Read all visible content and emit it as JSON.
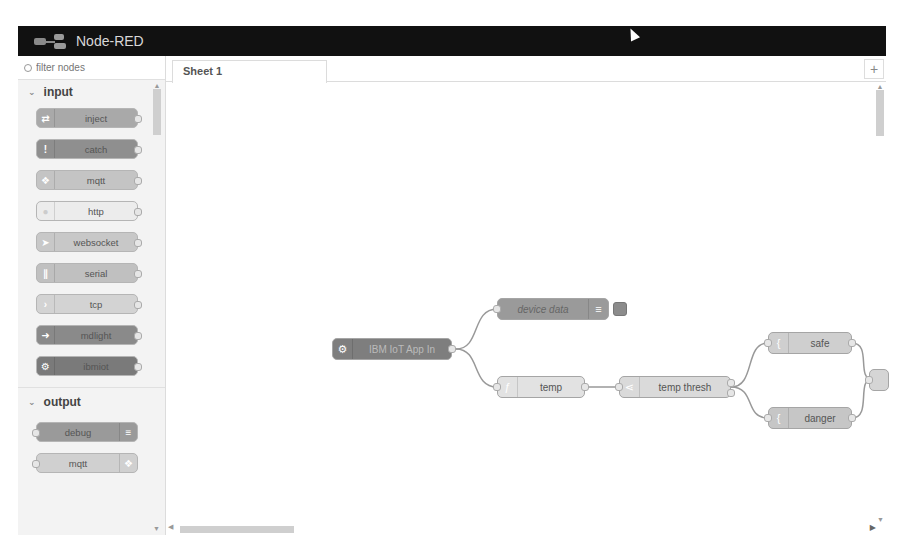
{
  "header": {
    "title": "Node-RED"
  },
  "palette": {
    "filter": {
      "placeholder": "filter nodes",
      "value": ""
    },
    "categories": [
      {
        "label": "input",
        "nodes": [
          {
            "label": "inject",
            "icon": "arrow-icon",
            "color": "#a6bbcf"
          },
          {
            "label": "catch",
            "icon": "exclamation-icon",
            "color": "#8f8f8f"
          },
          {
            "label": "mqtt",
            "icon": "bridge-icon",
            "color": "#c4c4c4"
          },
          {
            "label": "http",
            "icon": "globe-icon",
            "color": "#e6e6e6"
          },
          {
            "label": "websocket",
            "icon": "arrow-icon",
            "color": "#c8c8c8"
          },
          {
            "label": "serial",
            "icon": "serial-icon",
            "color": "#c0c0c0"
          },
          {
            "label": "tcp",
            "icon": "bridge-icon",
            "color": "#d0d0d0"
          },
          {
            "label": "mdlight",
            "icon": "light-icon",
            "color": "#8a8a8a"
          },
          {
            "label": "ibmiot",
            "icon": "gear-icon",
            "color": "#7a7a7a"
          }
        ]
      },
      {
        "label": "output",
        "nodes": [
          {
            "label": "debug",
            "icon": "list-icon",
            "color": "#9a9a9a"
          },
          {
            "label": "mqtt",
            "icon": "bridge-icon",
            "color": "#d0d0d0"
          }
        ]
      }
    ]
  },
  "workspace": {
    "tabs": [
      {
        "label": "Sheet 1"
      }
    ],
    "add_tab_label": "+",
    "flow": {
      "nodes": [
        {
          "id": "iot",
          "label": "IBM IoT App In",
          "x": 166,
          "y": 255,
          "w": 120,
          "color": "#7e7e7e",
          "icon": "gear-icon"
        },
        {
          "id": "device",
          "label": "device data",
          "x": 331,
          "y": 215,
          "w": 112,
          "color": "#9a9a9a",
          "icon": "list-icon"
        },
        {
          "id": "temp",
          "label": "temp",
          "x": 331,
          "y": 293,
          "w": 88,
          "color": "#e2e2e2",
          "icon": "function-icon"
        },
        {
          "id": "thresh",
          "label": "temp thresh",
          "x": 453,
          "y": 293,
          "w": 112,
          "color": "#dadada",
          "icon": "switch-icon"
        },
        {
          "id": "safe",
          "label": "safe",
          "x": 602,
          "y": 249,
          "w": 84,
          "color": "#cfcfcf",
          "icon": "template-icon"
        },
        {
          "id": "danger",
          "label": "danger",
          "x": 602,
          "y": 324,
          "w": 84,
          "color": "#c6c6c6",
          "icon": "template-icon"
        }
      ]
    }
  }
}
